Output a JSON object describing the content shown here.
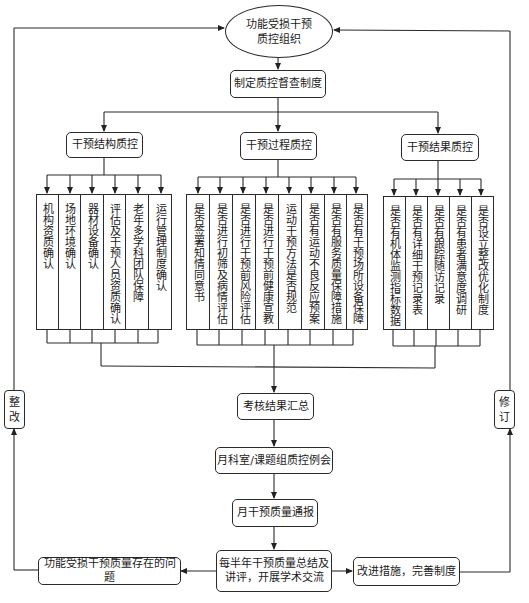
{
  "diagram": {
    "top": {
      "organization": "功能受损干预质控组织",
      "organization_line1": "功能受损干预",
      "organization_line2": "质控组织",
      "policy": "制定质控督查制度"
    },
    "branches": [
      {
        "title": "干预结构质控",
        "items": [
          "机构资质确认",
          "场地环境确认",
          "器材设备确认",
          "评估及干预人员资质确认",
          "老年多学科团队保障",
          "运行管理制度确认"
        ]
      },
      {
        "title": "干预过程质控",
        "items": [
          "是否签署知情同意书",
          "是否进行初筛及病情评估",
          "是否进行干预前风险评估",
          "是否进行干预前健康宣教",
          "运动干预方法是否规范",
          "是否有运动不良反应预案",
          "是否有服务质量保障措施",
          "是否有干预场所设备保障"
        ]
      },
      {
        "title": "干预结果质控",
        "items": [
          "是否有机体监测指标数据",
          "是否有详细干预记录表",
          "是否有跟踪随访记录",
          "是否有患者满意度调研",
          "是否设立整改优化制度"
        ]
      }
    ],
    "flow": {
      "summary": "考核结果汇总",
      "monthly_meeting": "月科室/课题组质控例会",
      "monthly_report": "月干预质量通报",
      "semiannual_line1": "每半年干预质量总结及",
      "semiannual_line2": "讲评，开展学术交流",
      "problems": "功能受损干预质量存在的问题",
      "improvements": "改进措施，完善制度"
    },
    "feedback": {
      "left": [
        "整",
        "改"
      ],
      "right": [
        "修",
        "订"
      ]
    }
  }
}
